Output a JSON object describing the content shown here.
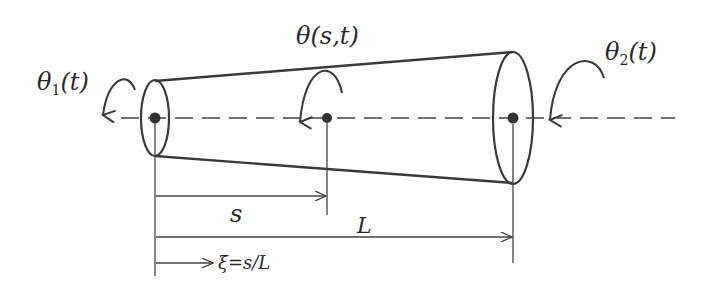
{
  "diagram": {
    "type": "tapered-shaft-torsion",
    "labels": {
      "theta1": {
        "symbol": "θ",
        "subscript": "1",
        "arg": "(t)"
      },
      "theta_mid": "θ(s,t)",
      "theta2": {
        "symbol": "θ",
        "subscript": "2",
        "arg": "(t)"
      },
      "s": "s",
      "L": "L",
      "xi": "→ ξ=s/L"
    },
    "colors": {
      "line": "#3a3a3a",
      "background": "#ffffff"
    }
  }
}
